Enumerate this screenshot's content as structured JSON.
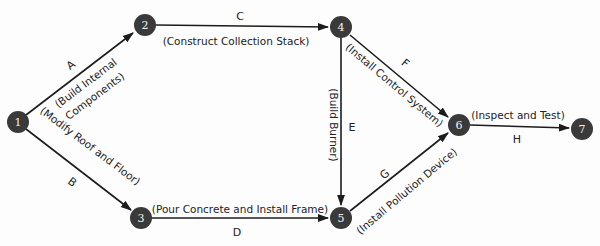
{
  "diagram": {
    "type": "activity-on-arrow network",
    "nodes": [
      {
        "id": "1",
        "label": "1",
        "x": 18,
        "y": 122
      },
      {
        "id": "2",
        "label": "2",
        "x": 145,
        "y": 25
      },
      {
        "id": "3",
        "label": "3",
        "x": 141,
        "y": 218
      },
      {
        "id": "4",
        "label": "4",
        "x": 341,
        "y": 27
      },
      {
        "id": "5",
        "label": "5",
        "x": 341,
        "y": 218
      },
      {
        "id": "6",
        "label": "6",
        "x": 459,
        "y": 125
      },
      {
        "id": "7",
        "label": "7",
        "x": 582,
        "y": 129
      }
    ],
    "activities": [
      {
        "letter": "A",
        "description": "(Build Internal",
        "description2": "Components)",
        "from": "1",
        "to": "2"
      },
      {
        "letter": "B",
        "description": "(Modify Roof and Floor)",
        "from": "1",
        "to": "3"
      },
      {
        "letter": "C",
        "description": "(Construct Collection Stack)",
        "from": "2",
        "to": "4"
      },
      {
        "letter": "D",
        "description": "(Pour Concrete and Install Frame)",
        "from": "3",
        "to": "5"
      },
      {
        "letter": "E",
        "description": "(Build Burner)",
        "from": "4",
        "to": "5"
      },
      {
        "letter": "F",
        "description": "(Install Control System)",
        "from": "4",
        "to": "6"
      },
      {
        "letter": "G",
        "description": "(Install Pollution Device)",
        "from": "5",
        "to": "6"
      },
      {
        "letter": "H",
        "description": "(Inspect and Test)",
        "from": "6",
        "to": "7"
      }
    ]
  }
}
